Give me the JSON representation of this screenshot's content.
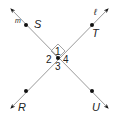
{
  "diagram": {
    "type": "perpendicular-lines",
    "line_color": "#9a9a9a",
    "point_color": "#111111",
    "lines": [
      {
        "name": "m",
        "from": [
          11,
          9
        ],
        "to": [
          108,
          108
        ],
        "label": "m",
        "label_pos": [
          15,
          23
        ]
      },
      {
        "name": "l",
        "from": [
          108,
          9
        ],
        "to": [
          11,
          108
        ],
        "label": "ℓ",
        "label_pos": [
          94,
          15
        ]
      }
    ],
    "intersection": {
      "pos": [
        58,
        58
      ]
    },
    "right_angle_marker": {
      "points": [
        [
          58,
          44
        ],
        [
          65,
          51
        ],
        [
          58,
          58
        ],
        [
          51,
          51
        ]
      ]
    },
    "points": [
      {
        "name": "S",
        "label": "S",
        "pos": [
          26,
          25
        ],
        "label_pos": [
          34,
          28
        ]
      },
      {
        "name": "T",
        "label": "T",
        "pos": [
          92,
          25
        ],
        "label_pos": [
          92,
          37
        ]
      },
      {
        "name": "R",
        "label": "R",
        "pos": [
          26,
          91
        ],
        "label_pos": [
          18,
          111
        ]
      },
      {
        "name": "U",
        "label": "U",
        "pos": [
          92,
          91
        ],
        "label_pos": [
          92,
          111
        ]
      }
    ],
    "angle_labels": [
      {
        "label": "1",
        "pos": [
          55,
          55
        ]
      },
      {
        "label": "2",
        "pos": [
          46,
          63
        ]
      },
      {
        "label": "4",
        "pos": [
          63,
          63
        ]
      },
      {
        "label": "3",
        "pos": [
          55,
          70
        ]
      }
    ]
  }
}
